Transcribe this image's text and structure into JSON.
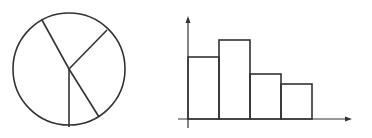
{
  "colors": {
    "stroke": "#333333",
    "background": "#ffffff"
  },
  "chart_data": [
    {
      "type": "pie",
      "title": "",
      "labels": [],
      "slice_count": 5,
      "geometry": {
        "cx": 69,
        "cy": 69,
        "r": 56
      },
      "spoke_endpoints": [
        [
          42,
          20
        ],
        [
          107,
          30
        ],
        [
          99,
          117
        ],
        [
          69,
          127
        ]
      ],
      "approx_slice_fractions": [
        0.24,
        0.2,
        0.15,
        0.08,
        0.33
      ]
    },
    {
      "type": "bar",
      "title": "",
      "xlabel": "",
      "ylabel": "",
      "categories": [
        "",
        "",
        "",
        ""
      ],
      "values": [
        62,
        79,
        45,
        35
      ],
      "geometry": {
        "axis_x": 188,
        "baseline_y": 119,
        "bar_left": 188,
        "bar_width": 31,
        "y_top": 16,
        "x_right": 352
      },
      "grid": false,
      "legend": "none"
    }
  ]
}
